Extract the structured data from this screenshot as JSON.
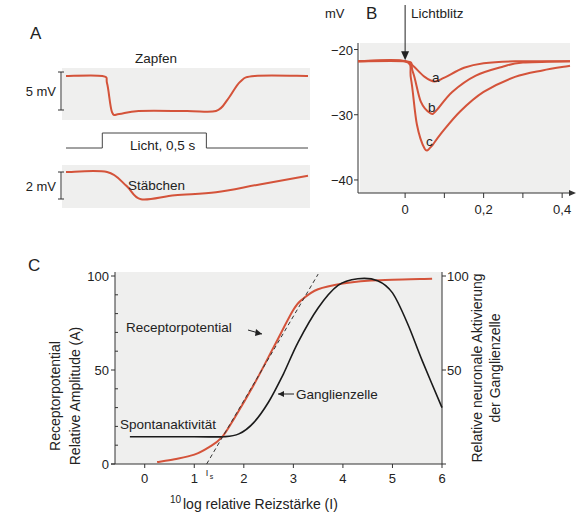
{
  "colors": {
    "receptor": "#d4533a",
    "ganglion": "#1a1a1a",
    "background": "#efefee"
  },
  "chart_data": [
    {
      "panel": "A",
      "type": "line",
      "title": "A",
      "traces": [
        {
          "name": "Zapfen",
          "scale_bar": "5 mV",
          "description": "Cone response: fast hyperpolarisation at light onset with small overshoot, plateau, fast recovery at light offset",
          "t_rel": [
            0,
            0.15,
            0.17,
            0.19,
            0.22,
            0.3,
            0.5,
            0.62,
            0.67,
            0.72,
            0.78,
            1.0
          ],
          "v_rel": [
            1.0,
            1.0,
            0.8,
            0.05,
            0.0,
            0.08,
            0.08,
            0.08,
            0.4,
            0.85,
            1.0,
            1.0
          ]
        },
        {
          "name": "Stäbchen",
          "scale_bar": "2 mV",
          "description": "Rod response: slower hyperpolarisation and very slow recovery outlasting the stimulus",
          "t_rel": [
            0,
            0.17,
            0.25,
            0.31,
            0.45,
            0.62,
            0.8,
            1.0
          ],
          "v_rel": [
            1.0,
            1.0,
            0.55,
            0.12,
            0.25,
            0.35,
            0.6,
            0.88
          ]
        }
      ],
      "stimulus": {
        "label": "Licht, 0,5 s",
        "on_rel": 0.15,
        "off_rel": 0.58
      }
    },
    {
      "panel": "B",
      "type": "line",
      "title": "B",
      "ylabel": "mV",
      "xlabel": "s",
      "annotation": "Lichtblitz",
      "xlim": [
        -0.12,
        0.42
      ],
      "ylim": [
        -42,
        -19
      ],
      "xticks": [
        "0",
        "0,2",
        "0,4"
      ],
      "xtick_values": [
        0,
        0.2,
        0.4
      ],
      "xminor": [
        0.1,
        0.3
      ],
      "yticks": [
        "−20",
        "−30",
        "−40"
      ],
      "ytick_values": [
        -20,
        -30,
        -40
      ],
      "series": [
        {
          "name": "a",
          "x": [
            -0.12,
            0.0,
            0.02,
            0.05,
            0.075,
            0.1,
            0.15,
            0.2,
            0.28,
            0.42
          ],
          "y": [
            -21.8,
            -21.8,
            -22.5,
            -24.2,
            -24.9,
            -24.3,
            -22.8,
            -22.1,
            -21.8,
            -21.8
          ]
        },
        {
          "name": "b",
          "x": [
            -0.12,
            0.0,
            0.02,
            0.04,
            0.065,
            0.08,
            0.12,
            0.18,
            0.25,
            0.3,
            0.42
          ],
          "y": [
            -21.8,
            -21.8,
            -23.5,
            -28.0,
            -29.8,
            -29.3,
            -26.5,
            -24.0,
            -22.6,
            -22.0,
            -21.8
          ]
        },
        {
          "name": "c",
          "x": [
            -0.12,
            0.0,
            0.015,
            0.03,
            0.05,
            0.065,
            0.09,
            0.14,
            0.2,
            0.28,
            0.35,
            0.42
          ],
          "y": [
            -21.8,
            -21.8,
            -24.5,
            -31.5,
            -35.2,
            -35.0,
            -33.0,
            -29.5,
            -26.5,
            -24.2,
            -23.2,
            -22.5
          ]
        }
      ]
    },
    {
      "panel": "C",
      "type": "line",
      "title": "C",
      "xlabel": "log relative Reizstärke (I)",
      "xlabel_superscript": "10",
      "ylabel": [
        "Receptorpotential",
        "Relative Amplitude (A)"
      ],
      "ylabel_right": [
        "Relative neuronale Aktivierung",
        "der Ganglienzelle"
      ],
      "xlim": [
        -0.6,
        6
      ],
      "ylim": [
        0,
        100
      ],
      "xticks": [
        "0",
        "1",
        "2",
        "3",
        "4",
        "5",
        "6"
      ],
      "xtick_values": [
        0,
        1,
        2,
        3,
        4,
        5,
        6
      ],
      "yticks_left": [
        "0",
        "50",
        "100"
      ],
      "ytick_values": [
        0,
        50,
        100
      ],
      "yticks_right": [
        "50",
        "100"
      ],
      "ytick_right_values": [
        50,
        100
      ],
      "threshold_label": "I",
      "threshold_subscript": "s",
      "threshold_x": 1.25,
      "annotations": [
        "Receptorpotential",
        "Ganglienzelle",
        "Spontanaktivität"
      ],
      "series": [
        {
          "name": "Receptorpotential",
          "x": [
            0.25,
            0.6,
            1.0,
            1.3,
            1.55,
            1.8,
            2.2,
            2.6,
            3.0,
            3.2,
            3.5,
            4.0,
            4.5,
            5.0,
            5.8
          ],
          "y": [
            1,
            2.5,
            5,
            9,
            14,
            24,
            42,
            62,
            82,
            88,
            93,
            96,
            97.5,
            98,
            98.5
          ]
        },
        {
          "name": "Ganglienzelle",
          "x": [
            -0.3,
            1.0,
            1.6,
            1.9,
            2.2,
            2.5,
            2.8,
            3.1,
            3.5,
            3.9,
            4.3,
            4.7,
            5.0,
            5.3,
            5.6,
            6.0
          ],
          "y": [
            14.5,
            14.5,
            14.5,
            16,
            22,
            33,
            48,
            65,
            83,
            95,
            98.5,
            97.5,
            91,
            75,
            55,
            30
          ]
        },
        {
          "name": "Tangente",
          "style": "dashed",
          "x": [
            1.25,
            3.5
          ],
          "y": [
            0,
            101
          ]
        }
      ]
    }
  ]
}
